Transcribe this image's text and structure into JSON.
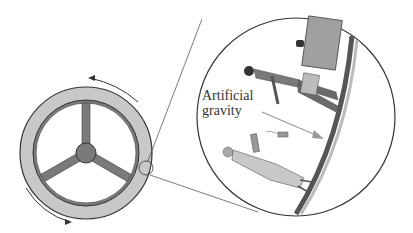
{
  "diagram": {
    "annotation": {
      "line1": "Artificial",
      "line2": "gravity"
    },
    "colors": {
      "ring_fill": "#c8c8c8",
      "spoke_fill": "#7a7a7a",
      "outline": "#333333",
      "arrow": "#888888",
      "background": "#ffffff"
    },
    "elements": [
      "station-wheel",
      "rotation-arrow-top",
      "rotation-arrow-bottom",
      "magnifier-circle",
      "magnified-view",
      "standing-man",
      "standing-woman",
      "gravity-arrow"
    ]
  }
}
